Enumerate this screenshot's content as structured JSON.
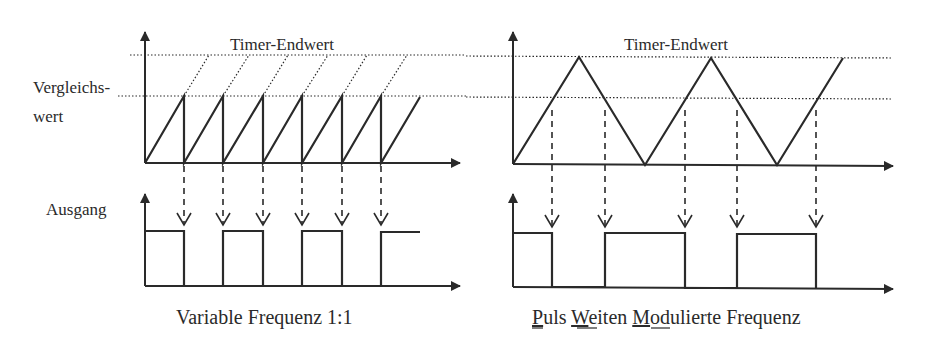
{
  "colors": {
    "ink": "#2a2a2a",
    "background": "#ffffff"
  },
  "left_panel": {
    "timer_end_label": "Timer-Endwert",
    "compare_label_line1": "Vergleichs-",
    "compare_label_line2": "wert",
    "output_label": "Ausgang",
    "caption": "Variable Frequenz 1:1",
    "signal_type": "sawtooth",
    "compare_events_x": [
      184,
      223,
      263,
      302,
      342,
      381
    ],
    "output_edges": [
      "high",
      "low",
      "high",
      "low",
      "high",
      "low",
      "high"
    ]
  },
  "right_panel": {
    "timer_end_label": "Timer-Endwert",
    "caption_parts": [
      {
        "text": "P",
        "underline": true
      },
      {
        "text": "uls ",
        "underline": false
      },
      {
        "text": "W",
        "underline": true
      },
      {
        "text": "eiten ",
        "underline": false
      },
      {
        "text": "M",
        "underline": true
      },
      {
        "text": "odulierte Frequenz",
        "underline": false
      }
    ],
    "caption_full": "Puls Weiten Modulierte Frequenz",
    "signal_type": "triangle",
    "compare_events_x": [
      552,
      605,
      685,
      737,
      816
    ]
  }
}
